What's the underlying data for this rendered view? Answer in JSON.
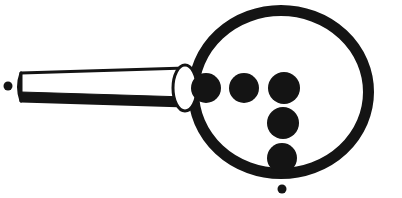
{
  "image": {
    "title": "Magnifying glass line drawing with five filled dots",
    "width": 402,
    "height": 198,
    "background_color": "#ffffff",
    "ink_color": "#141414",
    "style": "monochrome scanned line art, no text"
  },
  "palette": {
    "ink": "#141414",
    "paper": "#ffffff",
    "lens_interior": "#ffffff"
  },
  "shapes": {
    "lens_ring": {
      "name": "lens-ring",
      "type": "circle-outline",
      "cx": 281,
      "cy": 92,
      "rx": 93,
      "ry": 87,
      "stroke_width": 11,
      "fill": "none",
      "stroke": "#141414"
    },
    "ferrule": {
      "name": "ferrule-ellipse",
      "type": "ellipse-outline",
      "cx": 185,
      "cy": 88,
      "rx": 12,
      "ry": 23,
      "stroke_width": 3,
      "fill": "#ffffff",
      "stroke": "#141414"
    },
    "handle": {
      "name": "handle-bar",
      "type": "tapered-bar",
      "x_left": 21,
      "x_right": 186,
      "y_top_left": 73,
      "y_bottom_left": 101,
      "y_top_right": 68,
      "y_bottom_right": 106,
      "top_stroke_width": 3,
      "bottom_band_height": 9,
      "fill": "#ffffff",
      "stroke": "#141414"
    },
    "dots": [
      {
        "name": "dot-row1-left",
        "cx": 206,
        "cy": 88,
        "r": 15,
        "fill": "#141414",
        "row": 1,
        "column": 1
      },
      {
        "name": "dot-row1-center",
        "cx": 244,
        "cy": 88,
        "r": 15,
        "fill": "#141414",
        "row": 1,
        "column": 2
      },
      {
        "name": "dot-row1-right",
        "cx": 284,
        "cy": 88,
        "r": 16,
        "fill": "#141414",
        "row": 1,
        "column": 3
      },
      {
        "name": "dot-row2-center",
        "cx": 283,
        "cy": 123,
        "r": 16,
        "fill": "#141414",
        "row": 2,
        "column": 1
      },
      {
        "name": "dot-row3-center",
        "cx": 282,
        "cy": 158,
        "r": 15,
        "fill": "#141414",
        "row": 3,
        "column": 1
      }
    ],
    "speck_left": {
      "name": "speck-left",
      "cx": 8,
      "cy": 86,
      "r": 4.5,
      "fill": "#141414"
    },
    "speck_bottom": {
      "name": "speck-bottom",
      "cx": 282,
      "cy": 189,
      "r": 4.5,
      "fill": "#141414"
    }
  },
  "counts": {
    "large_dots": 5,
    "small_specks": 2,
    "total_marks": 7
  }
}
